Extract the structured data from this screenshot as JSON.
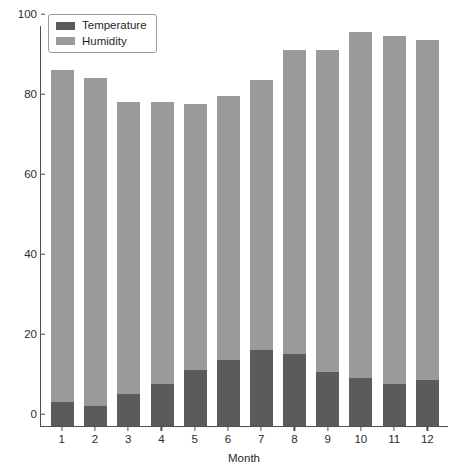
{
  "chart_data": {
    "type": "bar",
    "subtype": "stacked",
    "title": "",
    "xlabel": "Month",
    "ylabel": "",
    "categories": [
      "1",
      "2",
      "3",
      "4",
      "5",
      "6",
      "7",
      "8",
      "9",
      "10",
      "11",
      "12"
    ],
    "series": [
      {
        "name": "Temperature",
        "color": "#5b5b5b",
        "values": [
          6,
          5,
          8,
          10.5,
          14,
          16.5,
          19,
          18,
          13.5,
          12,
          10.5,
          11.5
        ]
      },
      {
        "name": "Humidity",
        "color": "#9a9a9a",
        "values": [
          83,
          82,
          73,
          70.5,
          66.5,
          66,
          67.5,
          76,
          80.5,
          86.5,
          87,
          85
        ]
      }
    ],
    "stacked_totals": [
      89,
      87,
      81,
      81,
      80.5,
      82.5,
      86.5,
      94,
      94,
      98.5,
      97.5,
      96.5
    ],
    "ylim": [
      0,
      100
    ],
    "xlim_categories": 12,
    "yticks": [
      0,
      20,
      40,
      60,
      80,
      100
    ],
    "ytick_labels": [
      "0",
      "20",
      "40",
      "60",
      "80",
      "100"
    ],
    "grid": false,
    "legend_position": "top-left",
    "legend_entries": [
      "Temperature",
      "Humidity"
    ]
  },
  "axes": {
    "x_title": "Month",
    "y_ticks": [
      {
        "value": 100,
        "label": "100"
      },
      {
        "value": 80,
        "label": "80"
      },
      {
        "value": 60,
        "label": "60"
      },
      {
        "value": 40,
        "label": "40"
      },
      {
        "value": 20,
        "label": "20"
      },
      {
        "value": 0,
        "label": "0"
      }
    ],
    "x_ticks": [
      "1",
      "2",
      "3",
      "4",
      "5",
      "6",
      "7",
      "8",
      "9",
      "10",
      "11",
      "12"
    ]
  },
  "legend": {
    "items": [
      {
        "label": "Temperature",
        "color": "#5b5b5b"
      },
      {
        "label": "Humidity",
        "color": "#9a9a9a"
      }
    ]
  },
  "colors": {
    "temperature": "#5b5b5b",
    "humidity": "#9a9a9a",
    "axis": "#4d4d4d",
    "text": "#2b2b2b",
    "background": "#ffffff"
  }
}
